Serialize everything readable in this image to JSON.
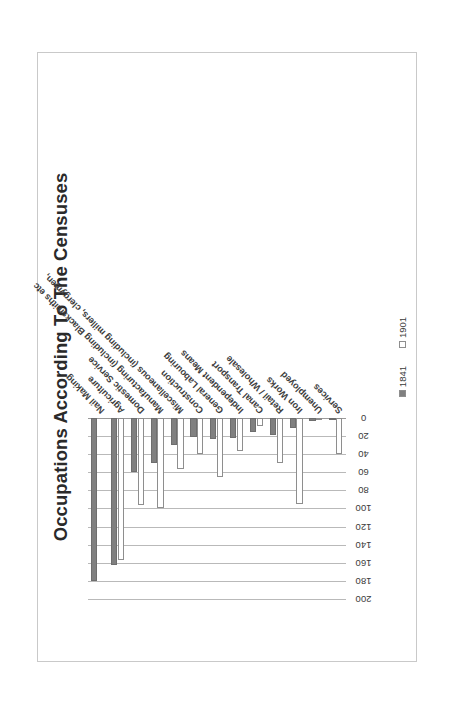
{
  "chart_data": {
    "type": "bar",
    "orientation": "horizontal",
    "title": "Occupations According To The Censuses",
    "xlabel": "",
    "ylabel": "",
    "xlim": [
      0,
      200
    ],
    "xticks": [
      0,
      20,
      40,
      60,
      80,
      100,
      120,
      140,
      160,
      180,
      200
    ],
    "grid": true,
    "legend_position": "bottom",
    "categories": [
      "Nail Making",
      "Agriculture",
      "Domestic Service",
      "Manufacturing (including Blacksmiths etc",
      "Miscellaneous (including millers, clergymen,",
      "Construction",
      "General Labouring",
      "Independent Means",
      "Canal Transport",
      "Retail / Wholesale",
      "Iron Works",
      "Unemployed",
      "Services"
    ],
    "series": [
      {
        "name": "1841",
        "color": "#808080",
        "values": [
          180,
          162,
          60,
          50,
          30,
          21,
          23,
          22,
          16,
          19,
          11,
          3,
          2
        ]
      },
      {
        "name": "1901",
        "color": "#ffffff",
        "values": [
          0,
          157,
          96,
          100,
          56,
          40,
          65,
          37,
          9,
          50,
          95,
          2,
          40
        ]
      }
    ]
  },
  "legend": {
    "items": [
      {
        "label": "1841",
        "swatch": "filled-gray"
      },
      {
        "label": "1901",
        "swatch": "outline-white"
      }
    ]
  },
  "axis": {
    "tick_labels": [
      "200",
      "180",
      "160",
      "140",
      "120",
      "100",
      "80",
      "60",
      "40",
      "20",
      "0"
    ]
  }
}
